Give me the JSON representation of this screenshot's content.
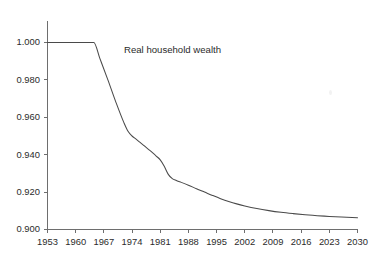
{
  "chart_data": {
    "type": "line",
    "title": "",
    "xlabel": "",
    "ylabel": "",
    "grid": false,
    "legend_position": "inline-annotation",
    "annotations": [
      {
        "text": "Real household wealth",
        "x": 1972,
        "y": 0.9955
      }
    ],
    "xlim": [
      1953,
      2030
    ],
    "ylim": [
      0.9,
      1.0
    ],
    "xticks": [
      1953,
      1960,
      1967,
      1974,
      1981,
      1988,
      1995,
      2002,
      2009,
      2016,
      2023,
      2030
    ],
    "xticklabels": [
      "1953",
      "1960",
      "1967",
      "1974",
      "1981",
      "1988",
      "1995",
      "2002",
      "2009",
      "2016",
      "2023",
      "2030"
    ],
    "yticks": [
      0.9,
      0.92,
      0.94,
      0.96,
      0.98,
      1.0
    ],
    "yticklabels": [
      "0.900",
      "0.920",
      "0.940",
      "0.960",
      "0.980",
      "1.000"
    ],
    "series": [
      {
        "name": "Real household wealth",
        "color": "#4a4a4a",
        "x": [
          1953,
          1956,
          1959,
          1962,
          1964.5,
          1966,
          1968,
          1970,
          1972,
          1973,
          1974,
          1975,
          1976,
          1977,
          1978,
          1979,
          1980,
          1981,
          1982,
          1983,
          1984,
          1985,
          1986,
          1988,
          1990,
          1992,
          1994,
          1996,
          1998,
          2000,
          2002,
          2005,
          2008,
          2011,
          2014,
          2017,
          2020,
          2023,
          2026,
          2030
        ],
        "values": [
          1.0,
          1.0,
          1.0,
          1.0,
          1.0,
          0.9915,
          0.98,
          0.968,
          0.957,
          0.9525,
          0.95,
          0.9483,
          0.9466,
          0.9448,
          0.943,
          0.9412,
          0.9393,
          0.9372,
          0.9338,
          0.9295,
          0.9272,
          0.9262,
          0.9254,
          0.9237,
          0.9218,
          0.92,
          0.9182,
          0.9165,
          0.915,
          0.9137,
          0.9126,
          0.9112,
          0.9101,
          0.9092,
          0.9085,
          0.9079,
          0.9074,
          0.907,
          0.9067,
          0.9063
        ]
      }
    ]
  },
  "axes": {
    "y_axis_name": "value-axis",
    "x_axis_name": "year-axis"
  }
}
